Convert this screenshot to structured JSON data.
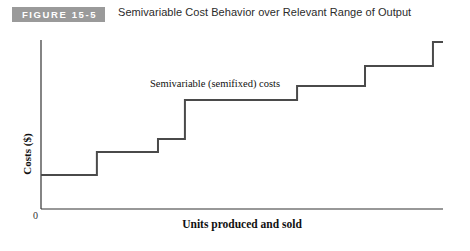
{
  "header": {
    "badge_label": "FIGURE 15-5",
    "title": "Semivariable Cost Behavior over Relevant Range of Output",
    "badge_bg_color": "#9a9a9a",
    "badge_text_color": "#ffffff"
  },
  "figure": {
    "origin_label": "0",
    "annotation": "Semivariable (semifixed) costs"
  },
  "chart_data": {
    "type": "line",
    "subtype": "step",
    "title": "Semivariable Cost Behavior over Relevant Range of Output",
    "xlabel": "Units produced and sold",
    "ylabel": "Costs ($)",
    "grid": false,
    "legend": null,
    "axis_ticks": {
      "x": [],
      "y": [],
      "origin": "0"
    },
    "xlim": [
      0,
      100
    ],
    "ylim": [
      0,
      100
    ],
    "line_color": "#4a4a4a",
    "line_width_px": 2,
    "annotations": [
      {
        "text": "Semivariable (semifixed) costs",
        "x": 27,
        "y": 75
      }
    ],
    "series": [
      {
        "name": "Semivariable (semifixed) costs",
        "steps": [
          {
            "x_start": 0,
            "x_end": 13.9,
            "y": 20.1
          },
          {
            "x_start": 13.9,
            "x_end": 29.1,
            "y": 33.7
          },
          {
            "x_start": 29.1,
            "x_end": 35.8,
            "y": 41.4
          },
          {
            "x_start": 35.8,
            "x_end": 63.7,
            "y": 64.5
          },
          {
            "x_start": 63.7,
            "x_end": 80.6,
            "y": 72.8
          },
          {
            "x_start": 80.6,
            "x_end": 97.5,
            "y": 84.6
          },
          {
            "x_start": 97.5,
            "x_end": 100,
            "y": 98.8
          }
        ]
      }
    ]
  }
}
